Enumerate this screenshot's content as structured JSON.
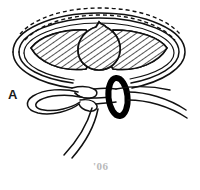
{
  "figure": {
    "background_color": "#ffffff",
    "ink_color": "#111111",
    "hatch_color": "#1a1a1a",
    "faint_color": "#b9b9b9",
    "width": 200,
    "height": 190
  },
  "labels": {
    "loop_label": "A",
    "corner_note": "'06"
  },
  "elements": {
    "outer_ligature_loop": "outer-ligature-loop",
    "dashed_hidden_arc": "dashed-hidden-arc",
    "hatched_mass_left": "hatched-mass-left",
    "hatched_mass_right": "hatched-mass-right",
    "hatched_bulge_center": "hatched-center-bulge",
    "knot": "knot",
    "free_loop": "free-loop",
    "black_ring": "black-ring",
    "cord_tail_left": "cord-tail-left",
    "cord_tail_right": "cord-tail-right"
  }
}
